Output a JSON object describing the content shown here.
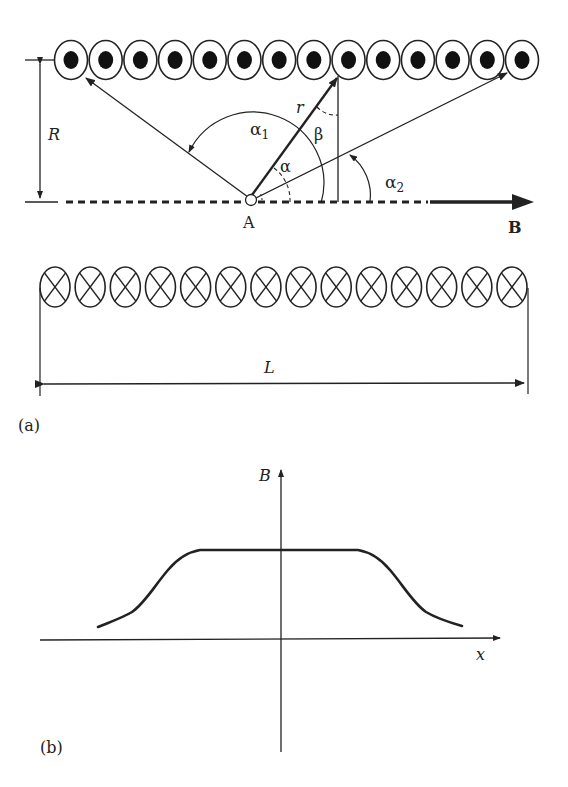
{
  "figure": {
    "panel_a": {
      "label": "(a)",
      "top_conductors": {
        "count": 14,
        "symbol": "dot",
        "meaning": "current out of page"
      },
      "bottom_conductors": {
        "count": 14,
        "symbol": "cross",
        "meaning": "current into page"
      },
      "labels": {
        "R": "R",
        "alpha1": "α",
        "alpha1_sub": "1",
        "alpha2": "α",
        "alpha2_sub": "2",
        "alpha": "α",
        "beta": "β",
        "r": "r",
        "A": "A",
        "B": "B",
        "L": "L"
      }
    },
    "panel_b": {
      "label": "(b)",
      "y_axis_label": "B",
      "x_axis_label": "x"
    }
  },
  "chart_data": {
    "type": "line",
    "title": "",
    "xlabel": "x",
    "ylabel": "B",
    "x": [
      -1.0,
      -0.85,
      -0.7,
      -0.6,
      -0.5,
      -0.4,
      0.0,
      0.4,
      0.5,
      0.6,
      0.7,
      0.85,
      1.0
    ],
    "y": [
      0.15,
      0.3,
      0.65,
      0.9,
      1.0,
      1.0,
      1.0,
      1.0,
      1.0,
      0.9,
      0.65,
      0.3,
      0.15
    ],
    "grid": false,
    "legend": null
  }
}
